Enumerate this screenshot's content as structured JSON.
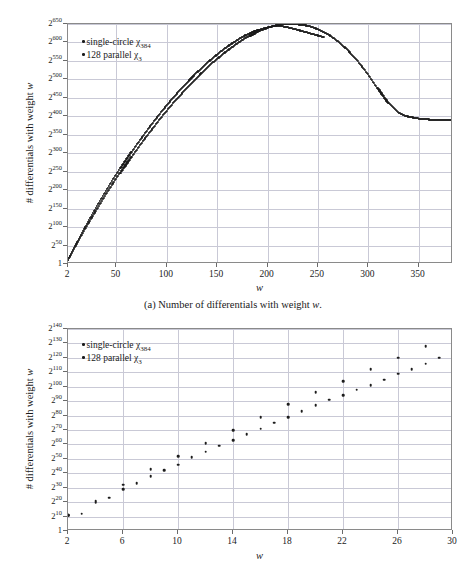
{
  "figures": [
    {
      "id": "a",
      "caption_prefix": "(a)",
      "caption_text": "Number of differentials with weight w.",
      "caption_full": "(a) Number of differentials with weight w."
    },
    {
      "id": "b",
      "caption_prefix": "(b)",
      "caption_text": "Number of differentials with weight w ≤ 30.",
      "caption_full": "(b) Number of differentials with weight w ≤ 30."
    }
  ],
  "legend": {
    "entries": [
      {
        "label": "single-circle χ384",
        "name": "single-circle",
        "sub": "384",
        "marker": "dot",
        "color": "#1c1c1c"
      },
      {
        "label": "128 parallel χ3",
        "name": "128 parallel",
        "sub": "3",
        "marker": "dot",
        "color": "#1c1c1c"
      }
    ]
  },
  "chart_data": [
    {
      "type": "scatter",
      "id": "chart-a",
      "title": "Number of differentials with weight w",
      "xlabel": "w",
      "ylabel": "# differentials with weight w",
      "xlim": [
        2,
        384
      ],
      "ylim": [
        0,
        650
      ],
      "y_scale": "log2",
      "grid": true,
      "legend_position": "top-left",
      "xticks": [
        2,
        50,
        100,
        150,
        200,
        250,
        300,
        350
      ],
      "xticklabels": [
        "2",
        "50",
        "100",
        "150",
        "200",
        "250",
        "300",
        "350"
      ],
      "yticks": [
        0,
        50,
        100,
        150,
        200,
        250,
        300,
        350,
        400,
        450,
        500,
        550,
        600,
        650
      ],
      "yticklabels": [
        "1",
        "2^50",
        "2^100",
        "2^150",
        "2^200",
        "2^250",
        "2^300",
        "2^350",
        "2^400",
        "2^450",
        "2^500",
        "2^550",
        "2^600",
        "2^650"
      ],
      "series": [
        {
          "name": "single-circle χ384",
          "color": "#1c1c1c",
          "x": [
            2,
            6,
            10,
            14,
            18,
            22,
            26,
            30,
            34,
            38,
            42,
            46,
            50,
            54,
            58,
            62,
            66,
            70,
            74,
            78,
            82,
            86,
            90,
            94,
            98,
            102,
            106,
            110,
            114,
            118,
            122,
            126,
            130,
            134,
            138,
            142,
            146,
            150,
            154,
            158,
            162,
            166,
            170,
            174,
            178,
            182,
            186,
            190,
            194,
            198,
            202,
            206,
            210,
            214,
            218,
            222,
            226,
            230,
            234,
            238,
            242,
            246,
            250,
            254,
            258,
            262,
            266,
            270,
            274,
            278,
            282,
            286,
            290,
            294,
            298,
            302,
            306,
            310,
            314,
            318,
            322,
            326,
            330,
            334,
            338,
            342,
            346,
            350,
            354,
            358,
            362,
            366,
            370,
            374,
            378,
            382,
            384
          ],
          "y": [
            11,
            30,
            50,
            70,
            89,
            108,
            126,
            144,
            162,
            180,
            197,
            214,
            231,
            247,
            263,
            279,
            295,
            310,
            325,
            340,
            354,
            368,
            382,
            396,
            409,
            422,
            435,
            447,
            459,
            471,
            483,
            494,
            505,
            516,
            526,
            536,
            546,
            555,
            564,
            573,
            581,
            589,
            597,
            604,
            611,
            617,
            623,
            629,
            634,
            638,
            642,
            645,
            647,
            649,
            650,
            650,
            650,
            649,
            648,
            646,
            644,
            640,
            636,
            631,
            625,
            619,
            611,
            603,
            594,
            584,
            573,
            561,
            549,
            535,
            521,
            506,
            490,
            474,
            458,
            443,
            430,
            419,
            410,
            404,
            400,
            398,
            396,
            394,
            393,
            392,
            391,
            390,
            390,
            389,
            389,
            389,
            389
          ]
        },
        {
          "name": "128 parallel χ3",
          "color": "#1c1c1c",
          "x": [
            2,
            6,
            10,
            14,
            18,
            22,
            26,
            30,
            34,
            38,
            42,
            46,
            50,
            54,
            58,
            62,
            66,
            70,
            74,
            78,
            82,
            86,
            90,
            94,
            98,
            102,
            106,
            110,
            114,
            118,
            122,
            126,
            130,
            134,
            138,
            142,
            146,
            150,
            154,
            158,
            162,
            166,
            170,
            174,
            178,
            182,
            186,
            190,
            194,
            198,
            202,
            206,
            210,
            214,
            218,
            222,
            226,
            230,
            234,
            238,
            242,
            246,
            250,
            254,
            256
          ],
          "y": [
            12,
            32,
            53,
            74,
            94,
            114,
            133,
            152,
            171,
            189,
            207,
            225,
            242,
            259,
            276,
            292,
            308,
            324,
            339,
            354,
            369,
            383,
            397,
            411,
            424,
            437,
            450,
            462,
            474,
            486,
            497,
            508,
            519,
            529,
            539,
            549,
            558,
            567,
            576,
            584,
            592,
            599,
            606,
            613,
            619,
            624,
            629,
            633,
            637,
            640,
            642,
            644,
            645,
            644,
            642,
            640,
            637,
            634,
            631,
            628,
            625,
            622,
            619,
            616,
            615
          ]
        }
      ]
    },
    {
      "type": "scatter",
      "id": "chart-b",
      "title": "Number of differentials with weight w ≤ 30",
      "xlabel": "w",
      "ylabel": "# differentials with weight w",
      "xlim": [
        2,
        30
      ],
      "ylim": [
        0,
        140
      ],
      "y_scale": "log2",
      "grid": true,
      "legend_position": "top-left",
      "xticks": [
        2,
        6,
        10,
        14,
        18,
        22,
        26,
        30
      ],
      "xticklabels": [
        "2",
        "6",
        "10",
        "14",
        "18",
        "22",
        "26",
        "30"
      ],
      "yticks": [
        0,
        10,
        20,
        30,
        40,
        50,
        60,
        70,
        80,
        90,
        100,
        110,
        120,
        130,
        140
      ],
      "yticklabels": [
        "1",
        "2^10",
        "2^20",
        "2^30",
        "2^40",
        "2^50",
        "2^60",
        "2^70",
        "2^80",
        "2^90",
        "2^100",
        "2^110",
        "2^120",
        "2^130",
        "2^140"
      ],
      "series": [
        {
          "name": "single-circle χ384",
          "color": "#1c1c1c",
          "x": [
            2,
            3,
            4,
            5,
            6,
            7,
            8,
            9,
            10,
            11,
            12,
            13,
            14,
            15,
            16,
            17,
            18,
            19,
            20,
            21,
            22,
            23,
            24,
            25,
            26,
            27,
            28,
            29,
            30
          ],
          "y": [
            11,
            12,
            20,
            23,
            29,
            33,
            38,
            42,
            46,
            51,
            55,
            59,
            63,
            67,
            71,
            75,
            79,
            83,
            87,
            91,
            94,
            98,
            101,
            105,
            109,
            112,
            116,
            120,
            123
          ]
        },
        {
          "name": "128 parallel χ3",
          "color": "#1c1c1c",
          "x": [
            2,
            4,
            6,
            8,
            10,
            12,
            14,
            16,
            18,
            20,
            22,
            24,
            26,
            28,
            30
          ],
          "y": [
            11,
            21,
            32,
            43,
            52,
            61,
            70,
            79,
            88,
            96,
            104,
            112,
            120,
            128,
            136
          ]
        }
      ]
    }
  ]
}
